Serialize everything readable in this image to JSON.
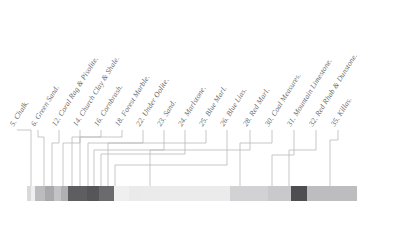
{
  "figure": {
    "width": 417,
    "height": 225,
    "background": "#ffffff",
    "label_color": "#5a5a5e",
    "leader_color": "#b9b9bd"
  },
  "colorbar": {
    "x": 27,
    "y": 186,
    "width": 330,
    "height": 15,
    "border_color": "#cfcfd2"
  },
  "chart_data": {
    "type": "table",
    "xlabel": "",
    "ylabel": "",
    "categories": [
      "5. Chalk.",
      "6. Green Sand.",
      "12. Coral Rag & Pisolite.",
      "14. Church Clay & Shale.",
      "16. Cornbrash.",
      "18. Forest Marble.",
      "22. Under Oolite.",
      "23. Sand.",
      "24. Marlstone.",
      "25. Blue Marl.",
      "26. Blue Lias.",
      "28. Red Marl.",
      "30. Coal Measures.",
      "31. Mountain Limestone.",
      "32. Red Rhab & Dunstone.",
      "35. Killas."
    ],
    "values": [
      4,
      4,
      10,
      9,
      7,
      7,
      19,
      12,
      14,
      15,
      14,
      87,
      38,
      22,
      16,
      50
    ],
    "colors": [
      "#d9d9da",
      "#efefef",
      "#bcbcbe",
      "#a9a9ab",
      "#c3c3c5",
      "#b0b0b2",
      "#5e5e60",
      "#565658",
      "#6b6b6d",
      "#efefef",
      "#eaeaea",
      "#ebebeb",
      "#d2d2d4",
      "#c9c9cb",
      "#4e4e50",
      "#bdbdbf"
    ]
  },
  "strata": [
    {
      "num": "5.",
      "name": "Chalk.",
      "label": "5. Chalk.",
      "label_x": 15,
      "label_y": 128,
      "tick_x": 31,
      "elbow_y": 130,
      "color": "#d9d9da"
    },
    {
      "num": "6.",
      "name": "Green Sand.",
      "label": "6. Green Sand.",
      "label_x": 36,
      "label_y": 128,
      "tick_x": 44,
      "elbow_y": 137,
      "color": "#efefef"
    },
    {
      "num": "12.",
      "name": "Coral Rag & Pisolite.",
      "label": "12. Coral Rag & Pisolite.",
      "label_x": 57,
      "label_y": 128,
      "tick_x": 52,
      "elbow_y": 143,
      "color": "#bcbcbe"
    },
    {
      "num": "14.",
      "name": "Church Clay & Shale.",
      "label": "14. Church Clay & Shale.",
      "label_x": 78,
      "label_y": 128,
      "tick_x": 63,
      "elbow_y": 143,
      "color": "#a9a9ab"
    },
    {
      "num": "16.",
      "name": "Cornbrash.",
      "label": "16. Cornbrash.",
      "label_x": 99,
      "label_y": 128,
      "tick_x": 72,
      "elbow_y": 137,
      "color": "#c3c3c5"
    },
    {
      "num": "18.",
      "name": "Forest Marble.",
      "label": "18. Forest Marble.",
      "label_x": 120,
      "label_y": 128,
      "tick_x": 80,
      "elbow_y": 137,
      "color": "#b0b0b2"
    },
    {
      "num": "22.",
      "name": "Under Oolite.",
      "label": "22. Under Oolite.",
      "label_x": 141,
      "label_y": 128,
      "tick_x": 88,
      "elbow_y": 143,
      "color": "#5e5e60"
    },
    {
      "num": "23.",
      "name": "Sand.",
      "label": "23. Sand.",
      "label_x": 162,
      "label_y": 128,
      "tick_x": 94,
      "elbow_y": 150,
      "color": "#565658"
    },
    {
      "num": "24.",
      "name": "Marlstone.",
      "label": "24. Marlstone.",
      "label_x": 183,
      "label_y": 128,
      "tick_x": 101,
      "elbow_y": 154,
      "color": "#6b6b6d"
    },
    {
      "num": "25.",
      "name": "Blue Marl.",
      "label": "25. Blue Marl.",
      "label_x": 204,
      "label_y": 128,
      "tick_x": 108,
      "elbow_y": 143,
      "color": "#efefef"
    },
    {
      "num": "26.",
      "name": "Blue Lias.",
      "label": "26. Blue Lias.",
      "label_x": 225,
      "label_y": 128,
      "tick_x": 115,
      "elbow_y": 165,
      "color": "#eaeaea"
    },
    {
      "num": "28.",
      "name": "Red Marl.",
      "label": "28. Red Marl.",
      "label_x": 248,
      "label_y": 128,
      "tick_x": 150,
      "elbow_y": 150,
      "color": "#ebebeb"
    },
    {
      "num": "30.",
      "name": "Coal Measures.",
      "label": "30. Coal Measures.",
      "label_x": 270,
      "label_y": 128,
      "tick_x": 240,
      "elbow_y": 143,
      "color": "#d2d2d4"
    },
    {
      "num": "31.",
      "name": "Mountain Limestone.",
      "label": "31. Mountain Limestone.",
      "label_x": 292,
      "label_y": 128,
      "tick_x": 272,
      "elbow_y": 155,
      "color": "#c9c9cb"
    },
    {
      "num": "32.",
      "name": "Red Rhab & Dunstone.",
      "label": "32. Red Rhab & Dunstone.",
      "label_x": 314,
      "label_y": 128,
      "tick_x": 289,
      "elbow_y": 150,
      "color": "#4e4e50"
    },
    {
      "num": "35.",
      "name": "Killas.",
      "label": "35. Killas.",
      "label_x": 336,
      "label_y": 128,
      "tick_x": 330,
      "elbow_y": 140,
      "color": "#bdbdbf"
    }
  ]
}
